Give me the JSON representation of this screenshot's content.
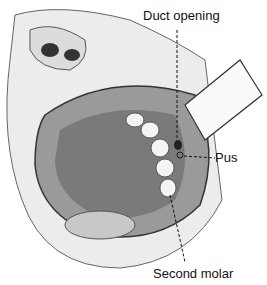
{
  "figure": {
    "labels": {
      "duct": "Duct opening",
      "pus": "Pus",
      "molar": "Second molar"
    }
  }
}
